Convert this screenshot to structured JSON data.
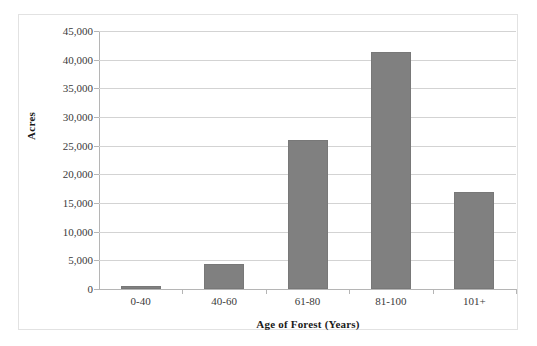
{
  "chart_data": {
    "type": "bar",
    "title": "",
    "subtitle": "",
    "categories": [
      "0-40",
      "40-60",
      "61-80",
      "81-100",
      "101+"
    ],
    "values": [
      600,
      4400,
      26000,
      41300,
      17000
    ],
    "xlabel": "Age of Forest (Years)",
    "ylabel": "Acres",
    "ylim": [
      0,
      45000
    ],
    "ytick_values": [
      0,
      5000,
      10000,
      15000,
      20000,
      25000,
      30000,
      35000,
      40000,
      45000
    ],
    "ytick_labels": [
      "0",
      "5,000",
      "10,000",
      "15,000",
      "20,000",
      "25,000",
      "30,000",
      "35,000",
      "40,000",
      "45,000"
    ],
    "grid": true,
    "grid_axis": "y",
    "legend": false,
    "legend_position": "none",
    "bar_color": "#808080",
    "grid_color": "#d3d3d3",
    "axis_color": "#b5b5b5",
    "plot_background": "#ffffff",
    "border_color": "#e2e2e2"
  }
}
